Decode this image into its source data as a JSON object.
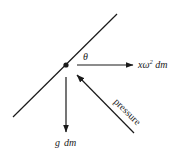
{
  "diagram": {
    "colors": {
      "stroke": "#1a1a1a",
      "background": "#ffffff"
    },
    "surface_line": {
      "label": ""
    },
    "mass_point": {
      "label": ""
    },
    "angle": {
      "symbol": "θ"
    },
    "forces": {
      "centrifugal": {
        "label_x": "x",
        "label_omega": "ω",
        "label_sup": "2",
        "label_dm": " dm"
      },
      "gravity": {
        "label_g": "g",
        "label_dm": "dm"
      },
      "pressure": {
        "label": "pressure"
      }
    }
  }
}
